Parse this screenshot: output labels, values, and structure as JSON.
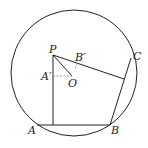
{
  "diagram": {
    "type": "geometry",
    "circle": {
      "cx": 74,
      "cy": 73,
      "r": 63
    },
    "points": {
      "P": {
        "label": "P",
        "x": 53,
        "y": 55
      },
      "O": {
        "label": "O",
        "x": 72,
        "y": 76
      },
      "A": {
        "label": "A",
        "x": 37,
        "y": 125
      },
      "B": {
        "label": "B",
        "x": 110,
        "y": 125
      },
      "C": {
        "label": "C",
        "x": 131,
        "y": 58
      },
      "A_prime": {
        "label": "A′",
        "x": 53,
        "y": 76
      },
      "B_prime": {
        "label": "B′",
        "x": 77,
        "y": 61
      }
    },
    "labels": {
      "P": "P",
      "O": "O",
      "A": "A",
      "B": "B",
      "C": "C",
      "A_prime": "A′",
      "B_prime": "B′"
    },
    "colors": {
      "stroke": "#222222",
      "dashed": "#888888",
      "background": "#ffffff"
    }
  }
}
